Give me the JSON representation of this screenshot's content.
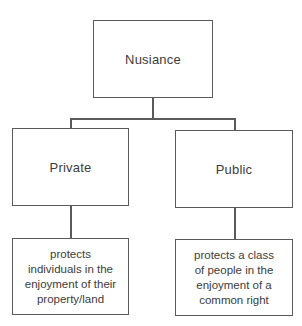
{
  "diagram": {
    "type": "tree",
    "root": {
      "label": "Nusiance"
    },
    "branches": [
      {
        "label": "Private",
        "description": "protects individuals in the enjoyment of their property/land",
        "description_lines": [
          "protects",
          "individuals in the",
          "enjoyment of their",
          "property/land"
        ]
      },
      {
        "label": "Public",
        "description": "protects a class of people in the enjoyment of a common right",
        "description_lines": [
          "protects a class",
          "of people in the",
          "enjoyment of a",
          "common right"
        ]
      }
    ],
    "colors": {
      "border": "#5a5a5a",
      "text": "#3c3c3c",
      "background": "#ffffff"
    }
  }
}
